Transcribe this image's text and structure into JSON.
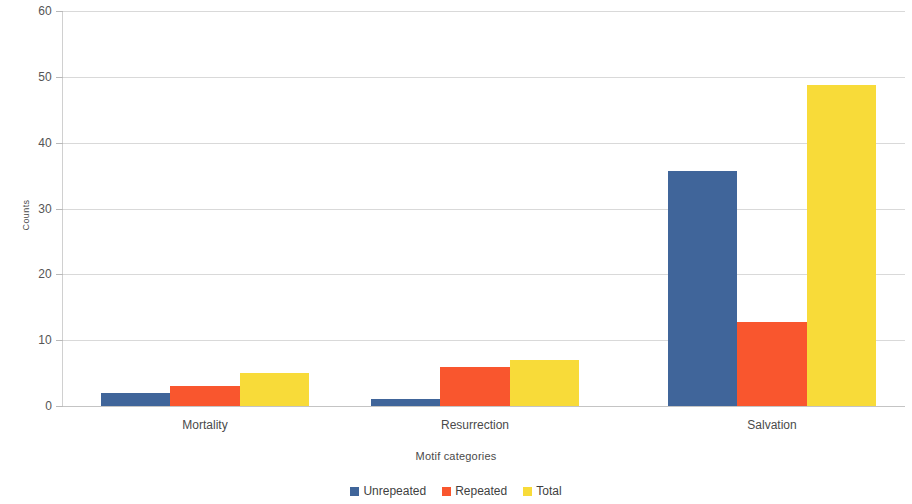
{
  "chart_data": {
    "type": "bar",
    "title": "",
    "xlabel": "Motif categories",
    "ylabel": "Counts",
    "categories": [
      "Mortality",
      "Resurrection",
      "Salvation"
    ],
    "series": [
      {
        "name": "Unrepeated",
        "color": "#40659a",
        "values": [
          2,
          1,
          35.7
        ]
      },
      {
        "name": "Repeated",
        "color": "#f9562e",
        "values": [
          3,
          6,
          12.7
        ]
      },
      {
        "name": "Total",
        "color": "#f8db39",
        "values": [
          5,
          7,
          48.8
        ]
      }
    ],
    "ylim": [
      0,
      60
    ],
    "yticks": [
      0,
      10,
      20,
      30,
      40,
      50,
      60
    ],
    "ytick_labels": [
      "0",
      "10",
      "20",
      "30",
      "40",
      "50",
      "60"
    ],
    "grid": true,
    "grid_axis": "y",
    "legend_position": "bottom",
    "bar_grouping": "grouped"
  },
  "axes": {
    "y_title": "Counts",
    "x_title": "Motif categories"
  },
  "legend": {
    "entries": [
      {
        "label": "Unrepeated",
        "color": "#40659a"
      },
      {
        "label": "Repeated",
        "color": "#f9562e"
      },
      {
        "label": "Total",
        "color": "#f8db39"
      }
    ]
  }
}
